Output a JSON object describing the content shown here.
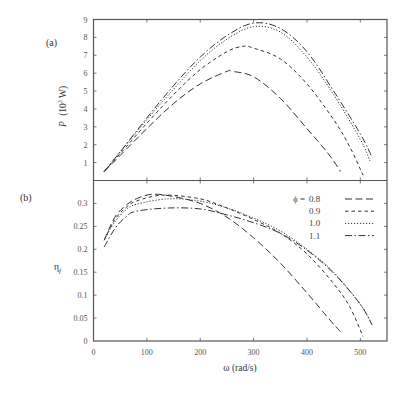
{
  "chart_data": [
    {
      "panel": "(a)",
      "type": "line",
      "title": "",
      "xlabel": "ω (rad/s)",
      "ylabel": "P (10^3 W)",
      "xlim": [
        0,
        550
      ],
      "ylim": [
        0,
        9
      ],
      "xticks": [
        0,
        100,
        200,
        300,
        400,
        500
      ],
      "yticks": [
        1,
        2,
        3,
        4,
        5,
        6,
        7,
        8,
        9
      ],
      "grid": false,
      "series": [
        {
          "name": "φ = 0.8",
          "style": "long-dash",
          "x": [
            20,
            50,
            100,
            150,
            200,
            250,
            260,
            300,
            350,
            400,
            440,
            463
          ],
          "y": [
            0.5,
            1.4,
            2.9,
            4.3,
            5.4,
            6.1,
            6.1,
            5.8,
            4.6,
            2.9,
            1.5,
            0.5
          ]
        },
        {
          "name": "φ = 0.9",
          "style": "short-dash",
          "x": [
            20,
            50,
            100,
            150,
            200,
            250,
            280,
            300,
            350,
            400,
            450,
            480,
            505
          ],
          "y": [
            0.5,
            1.5,
            3.2,
            4.8,
            6.2,
            7.2,
            7.5,
            7.4,
            6.8,
            5.4,
            3.4,
            1.9,
            0.3
          ]
        },
        {
          "name": "φ = 1.0",
          "style": "dotted",
          "x": [
            20,
            50,
            100,
            150,
            200,
            250,
            300,
            350,
            400,
            450,
            500,
            518
          ],
          "y": [
            0.5,
            1.6,
            3.4,
            5.1,
            6.7,
            7.9,
            8.6,
            8.3,
            6.9,
            4.8,
            2.3,
            1.1
          ]
        },
        {
          "name": "φ = 1.1",
          "style": "dash-dot",
          "x": [
            20,
            50,
            100,
            150,
            200,
            250,
            300,
            350,
            400,
            450,
            500,
            522
          ],
          "y": [
            0.5,
            1.6,
            3.5,
            5.3,
            6.9,
            8.1,
            8.8,
            8.5,
            7.2,
            5.0,
            2.6,
            1.3
          ]
        }
      ]
    },
    {
      "panel": "(b)",
      "type": "line",
      "title": "",
      "xlabel": "ω (rad/s)",
      "ylabel": "η_f",
      "xlim": [
        0,
        550
      ],
      "ylim": [
        0,
        0.35
      ],
      "xticks": [
        0,
        100,
        200,
        300,
        400,
        500
      ],
      "yticks": [
        0,
        0.05,
        0.1,
        0.15,
        0.2,
        0.25,
        0.3
      ],
      "grid": false,
      "legend_position": "upper right",
      "series": [
        {
          "name": "φ = 0.8",
          "style": "long-dash",
          "x": [
            20,
            40,
            60,
            80,
            110,
            150,
            200,
            250,
            300,
            350,
            400,
            440,
            463
          ],
          "y": [
            0.22,
            0.27,
            0.295,
            0.31,
            0.32,
            0.315,
            0.3,
            0.27,
            0.225,
            0.17,
            0.105,
            0.05,
            0.02
          ]
        },
        {
          "name": "φ = 0.9",
          "style": "short-dash",
          "x": [
            20,
            40,
            60,
            80,
            130,
            200,
            250,
            300,
            350,
            400,
            450,
            480,
            505
          ],
          "y": [
            0.22,
            0.265,
            0.29,
            0.305,
            0.318,
            0.31,
            0.29,
            0.265,
            0.235,
            0.19,
            0.125,
            0.075,
            0.01
          ]
        },
        {
          "name": "φ = 1.0",
          "style": "dotted",
          "x": [
            20,
            40,
            60,
            80,
            140,
            200,
            250,
            300,
            350,
            400,
            450,
            500,
            520
          ],
          "y": [
            0.22,
            0.26,
            0.285,
            0.298,
            0.31,
            0.305,
            0.29,
            0.268,
            0.24,
            0.2,
            0.15,
            0.08,
            0.04
          ]
        },
        {
          "name": "φ = 1.1",
          "style": "dash-dot",
          "x": [
            20,
            40,
            60,
            80,
            140,
            200,
            250,
            300,
            350,
            400,
            450,
            500,
            522
          ],
          "y": [
            0.205,
            0.245,
            0.27,
            0.283,
            0.29,
            0.288,
            0.275,
            0.258,
            0.235,
            0.198,
            0.148,
            0.08,
            0.035
          ]
        }
      ]
    }
  ],
  "labels": {
    "panel_a": "(a)",
    "panel_b": "(b)",
    "ylabel_a_main": "P",
    "ylabel_a_unit": "(10",
    "ylabel_a_exp": "3",
    "ylabel_a_tail": " W)",
    "ylabel_b_main": "η",
    "ylabel_b_sub": "f",
    "xlabel": "ω  (rad/s)",
    "legend_prefix": "ϕ ="
  },
  "legend": [
    {
      "label": "0.8",
      "style": "long-dash"
    },
    {
      "label": "0.9",
      "style": "short-dash"
    },
    {
      "label": "1.0",
      "style": "dotted"
    },
    {
      "label": "1.1",
      "style": "dash-dot"
    }
  ]
}
